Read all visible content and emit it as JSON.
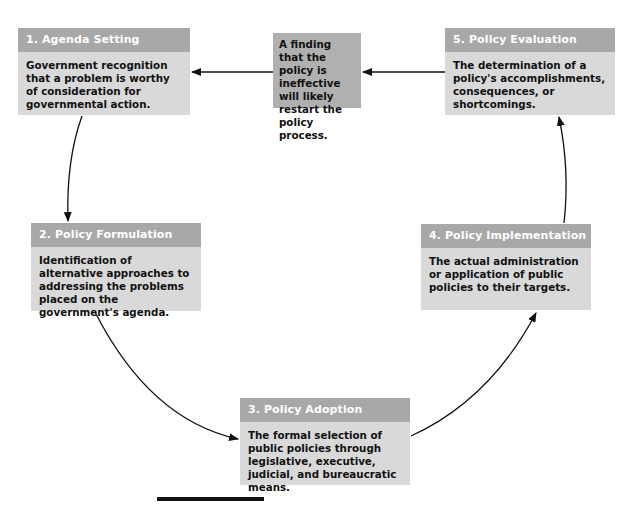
{
  "diagram": {
    "type": "policy-cycle",
    "stages": [
      {
        "title": "1. Agenda Setting",
        "description": "Government recognition that a problem is worthy of consideration for governmental action."
      },
      {
        "title": "2. Policy Formulation",
        "description": "Identification of alternative approaches to addressing the problems placed on the government's agenda."
      },
      {
        "title": "3. Policy Adoption",
        "description": "The formal selection of public policies through legislative, executive, judicial, and bureaucratic means."
      },
      {
        "title": "4. Policy Implementation",
        "description": "The actual administration or application of public policies to their targets."
      },
      {
        "title": "5. Policy Evaluation",
        "description": "The determination of a policy's accomplishments, consequences, or shortcomings."
      }
    ],
    "feedback_note": "A finding that the policy is ineffective will likely restart the policy process.",
    "colors": {
      "header": "#a8a8a8",
      "body": "#d9d9d9",
      "note": "#b0b0b0",
      "arrow": "#111111"
    }
  }
}
